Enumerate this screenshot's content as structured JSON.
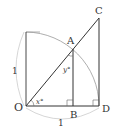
{
  "diagram": {
    "points": {
      "O": {
        "label": "O",
        "x": 26,
        "y": 106
      },
      "A": {
        "label": "A",
        "x": 73,
        "y": 49
      },
      "B": {
        "label": "B",
        "x": 73,
        "y": 106
      },
      "C": {
        "label": "C",
        "x": 99,
        "y": 18
      },
      "D": {
        "label": "D",
        "x": 99,
        "y": 106
      }
    },
    "angles": {
      "x": {
        "label": "x°"
      },
      "y": {
        "label": "y°"
      }
    },
    "lengths": {
      "vertical": {
        "label": "1"
      },
      "horizontal": {
        "label": "1"
      }
    },
    "colors": {
      "line": "#333333",
      "arc": "#999999",
      "dim_arc": "#cccccc"
    }
  }
}
